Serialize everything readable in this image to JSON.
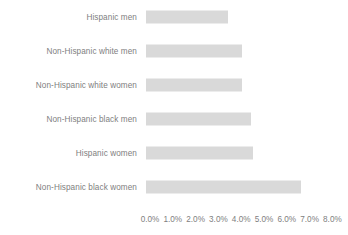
{
  "chart_data": {
    "type": "bar",
    "orientation": "horizontal",
    "title": "",
    "subtitle": "",
    "xlabel": "",
    "ylabel": "",
    "grid": false,
    "legend": false,
    "legend_position": "none",
    "bar_color": "#d9d9d9",
    "text_color": "#808080",
    "background_color": "#ffffff",
    "xlim": [
      0.0,
      8.0
    ],
    "xtick_labels": [
      "0.0%",
      "1.0%",
      "2.0%",
      "3.0%",
      "4.0%",
      "5.0%",
      "6.0%",
      "7.0%",
      "8.0%"
    ],
    "xtick_values": [
      0.0,
      1.0,
      2.0,
      3.0,
      4.0,
      5.0,
      6.0,
      7.0,
      8.0
    ],
    "categories": [
      "Hispanic men",
      "Non-Hispanic white men",
      "Non-Hispanic white women",
      "Non-Hispanic black men",
      "Hispanic women",
      "Non-Hispanic black women"
    ],
    "values": [
      3.6,
      4.2,
      4.2,
      4.6,
      4.7,
      6.8
    ],
    "value_labels": [
      "3.6%",
      "4.2%",
      "4.2%",
      "4.6%",
      "4.7%",
      "6.8%"
    ],
    "series": [
      {
        "name": "",
        "values": [
          3.6,
          4.2,
          4.2,
          4.6,
          4.7,
          6.8
        ]
      }
    ]
  }
}
